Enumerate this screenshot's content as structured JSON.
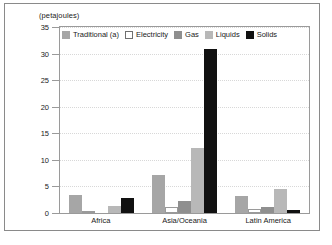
{
  "chart_data": {
    "type": "bar",
    "title": "",
    "subtitle": "",
    "axis_title": "(petajoules)",
    "xlabel": "",
    "ylabel": "(petajoules)",
    "ylim": [
      0,
      35
    ],
    "yticks": [
      0,
      5,
      10,
      15,
      20,
      25,
      30,
      35
    ],
    "grid": true,
    "legend_position": "top-inside",
    "categories": [
      "Africa",
      "Asia/Oceania",
      "Latin America"
    ],
    "series": [
      {
        "name": "Traditional (a)",
        "color": "#a6a6a6",
        "values": [
          3.4,
          7.1,
          3.2
        ]
      },
      {
        "name": "Electricity",
        "color": "#ffffff",
        "values": [
          0.1,
          1.2,
          0.8
        ]
      },
      {
        "name": "Gas",
        "color": "#8f8f8f",
        "values": [
          0.0,
          2.2,
          1.2
        ]
      },
      {
        "name": "Liquids",
        "color": "#b8b8b8",
        "values": [
          1.4,
          12.2,
          4.5
        ]
      },
      {
        "name": "Solids",
        "color": "#111111",
        "values": [
          2.8,
          30.8,
          0.6
        ]
      }
    ]
  },
  "colors": {
    "frame": "#8a8a8a",
    "axis": "#9a9a9a",
    "grid": "#d8d8d8",
    "text": "#1a1a1a",
    "background": "#ffffff"
  }
}
